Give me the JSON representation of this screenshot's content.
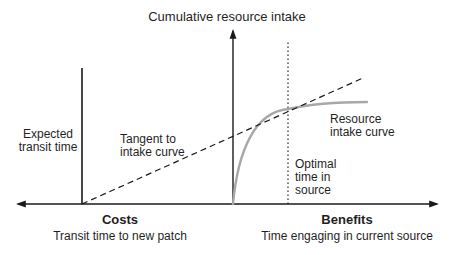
{
  "title": "Cumulative resource intake",
  "labels": {
    "expected_transit": [
      "Expected",
      "transit time"
    ],
    "tangent": [
      "Tangent to",
      "intake curve"
    ],
    "resource_curve": [
      "Resource",
      "intake curve"
    ],
    "optimal_time": [
      "Optimal",
      "time in",
      "source"
    ]
  },
  "costs": {
    "heading": "Costs",
    "subheading": "Transit time to new patch"
  },
  "benefits": {
    "heading": "Benefits",
    "subheading": "Time engaging in current source"
  },
  "colors": {
    "axis": "#1a1a1a",
    "curve": "#a8a8a8",
    "tangent": "#1a1a1a",
    "optimal_line": "#1a1a1a"
  }
}
